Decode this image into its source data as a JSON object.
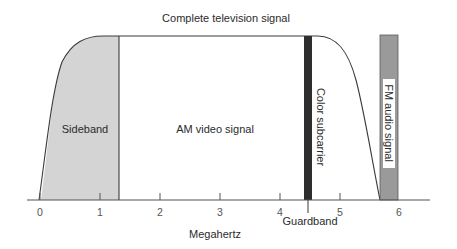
{
  "title": "Complete television signal",
  "x_axis": {
    "label": "Megahertz",
    "ticks": [
      "0",
      "1",
      "2",
      "3",
      "4",
      "5",
      "6"
    ]
  },
  "regions": {
    "sideband": {
      "label": "Sideband",
      "from_mhz": 0,
      "to_mhz": 1.25,
      "color": "#d4d4d4"
    },
    "am_video": {
      "label": "AM video signal"
    },
    "color_subcarrier": {
      "label": "Color subcarrier",
      "at_mhz": 4.5,
      "color": "#2e2e2e"
    },
    "fm_audio": {
      "label": "FM audio signal",
      "from_mhz": 5.7,
      "to_mhz": 6.0,
      "color": "#9a9a9a"
    },
    "guardband": {
      "label": "Guardband",
      "at_mhz": 4.5
    }
  },
  "colors": {
    "line": "#3a3a3a",
    "axis": "#555555",
    "background": "#ffffff"
  }
}
